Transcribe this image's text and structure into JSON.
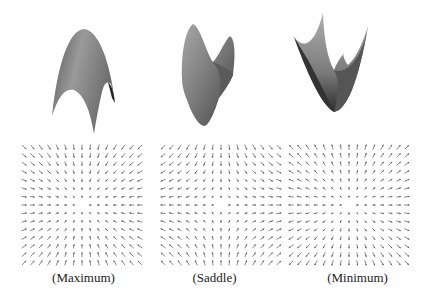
{
  "figure": {
    "panels": [
      {
        "id": "maximum",
        "caption": "(Maximum)",
        "type": "max"
      },
      {
        "id": "saddle",
        "caption": "(Saddle)",
        "type": "saddle"
      },
      {
        "id": "minimum",
        "caption": "(Minimum)",
        "type": "min"
      }
    ],
    "quiver": {
      "grid": 15,
      "arrow_color": "#555555"
    },
    "colors": {
      "surface_light": "#b8b8b8",
      "surface_mid": "#8a8a8a",
      "surface_dark": "#3a3a3a"
    }
  }
}
